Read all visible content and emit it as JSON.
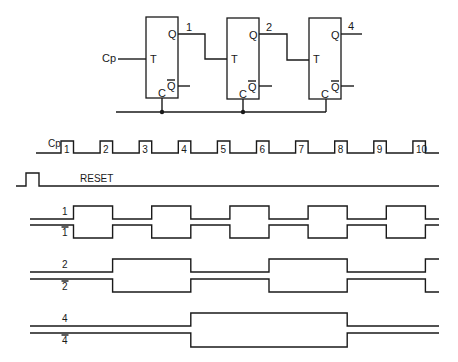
{
  "circuit": {
    "clock_input_label": "Cp",
    "flip_flops": [
      {
        "input_label": "T",
        "output_label": "Q",
        "inverted_output_label": "Q",
        "clear_label": "C",
        "output_name": "1"
      },
      {
        "input_label": "T",
        "output_label": "Q",
        "inverted_output_label": "Q",
        "clear_label": "C",
        "output_name": "2"
      },
      {
        "input_label": "T",
        "output_label": "Q",
        "inverted_output_label": "Q",
        "clear_label": "C",
        "output_name": "4"
      }
    ]
  },
  "timing": {
    "clock_label": "Cp",
    "clock_pulse_numbers": [
      "1",
      "2",
      "3",
      "4",
      "5",
      "6",
      "7",
      "8",
      "9",
      "10"
    ],
    "reset_label": "RESET",
    "signals": [
      {
        "name": "1",
        "inverted": false,
        "initial": 0,
        "toggle_after_pulses": [
          1,
          2,
          3,
          4,
          5,
          6,
          7,
          8,
          9,
          10
        ]
      },
      {
        "name": "1",
        "inverted": true,
        "initial": 1,
        "toggle_after_pulses": [
          1,
          2,
          3,
          4,
          5,
          6,
          7,
          8,
          9,
          10
        ]
      },
      {
        "name": "2",
        "inverted": false,
        "initial": 0,
        "toggle_after_pulses": [
          2,
          4,
          6,
          8,
          10
        ]
      },
      {
        "name": "2",
        "inverted": true,
        "initial": 1,
        "toggle_after_pulses": [
          2,
          4,
          6,
          8,
          10
        ]
      },
      {
        "name": "4",
        "inverted": false,
        "initial": 0,
        "toggle_after_pulses": [
          4,
          8
        ]
      },
      {
        "name": "4",
        "inverted": true,
        "initial": 1,
        "toggle_after_pulses": [
          4,
          8
        ]
      }
    ]
  }
}
